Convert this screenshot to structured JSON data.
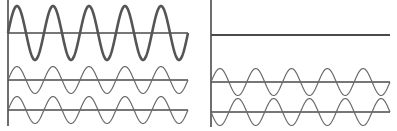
{
  "diagram": {
    "title": "",
    "panels": [
      {
        "id": "constructive",
        "description": "Constructive interference: two in-phase waves sum to a larger-amplitude wave",
        "resultant": {
          "type": "sine",
          "amplitude": 2,
          "cycles": 5,
          "phase": 0
        },
        "components": [
          {
            "type": "sine",
            "amplitude": 1,
            "cycles": 5,
            "phase": 0
          },
          {
            "type": "sine",
            "amplitude": 1,
            "cycles": 5,
            "phase": 0
          }
        ]
      },
      {
        "id": "destructive",
        "description": "Destructive interference: two out-of-phase waves cancel to a flat line",
        "resultant": {
          "type": "flat",
          "amplitude": 0,
          "cycles": 5,
          "phase": 0
        },
        "components": [
          {
            "type": "sine",
            "amplitude": 1,
            "cycles": 5,
            "phase": 0
          },
          {
            "type": "sine",
            "amplitude": 1,
            "cycles": 5,
            "phase": 180
          }
        ]
      }
    ],
    "colors": {
      "line": "#4a4a4a",
      "wave": "#555555",
      "background": "#ffffff"
    }
  }
}
